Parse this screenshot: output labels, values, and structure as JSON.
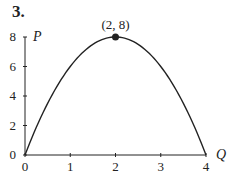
{
  "problem": {
    "number": "3."
  },
  "chart_data": {
    "type": "line",
    "title": "",
    "xlabel": "Q",
    "ylabel": "P",
    "xlim": [
      0,
      4
    ],
    "ylim": [
      0,
      8
    ],
    "x_ticks": [
      0,
      1,
      2,
      3,
      4
    ],
    "y_ticks": [
      0,
      2,
      4,
      6,
      8
    ],
    "grid": false,
    "series": [
      {
        "name": "P = 8Q - 2Q^2",
        "x": [
          0,
          0.25,
          0.5,
          0.75,
          1,
          1.25,
          1.5,
          1.75,
          2,
          2.25,
          2.5,
          2.75,
          3,
          3.25,
          3.5,
          3.75,
          4
        ],
        "values": [
          0,
          1.875,
          3.5,
          4.875,
          6,
          6.875,
          7.5,
          7.875,
          8,
          7.875,
          7.5,
          6.875,
          6,
          4.875,
          3.5,
          1.875,
          0
        ]
      }
    ],
    "annotations": [
      {
        "text": "(2, 8)",
        "x": 2,
        "y": 8,
        "marker": "filled-circle"
      }
    ]
  },
  "colors": {
    "line": "#222222",
    "axis": "#222222",
    "background": "#ffffff"
  }
}
